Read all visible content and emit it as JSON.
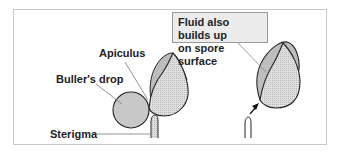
{
  "labels": {
    "apiculus": "Apiculus",
    "bullers_drop": "Buller's drop",
    "sterigma": "Sterigma",
    "callout_line1": "Fluid also builds up",
    "callout_line2": "on spore surface"
  },
  "colors": {
    "spore_fill": "#d9d9d9",
    "drop_fill": "#c8c8c8",
    "fluid_film": "#bdbdbd",
    "outline": "#222222",
    "frame_border": "#c8c8c8",
    "callout_bg": "#ececec"
  }
}
